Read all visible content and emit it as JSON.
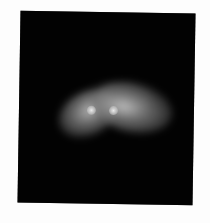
{
  "image": {
    "kind": "astronomical-photograph",
    "description": "Bilobed diffuse bright object with two compact bright cores on a black field, inside a slightly tilted black frame on white background",
    "colors": {
      "page_background": "#fdfdfd",
      "frame_background": "#020202",
      "glow_mid": "#8c8c8c",
      "core": "#e0e0e0"
    },
    "frame": {
      "top_left": [
        21,
        11
      ],
      "top_right": [
        195,
        14
      ],
      "bottom_left": [
        17,
        203
      ],
      "bottom_right": [
        192,
        205
      ]
    },
    "object": {
      "bounding_box": {
        "x": 60,
        "y": 85,
        "width": 92,
        "height": 50
      },
      "lobes": [
        {
          "name": "left-lower-lobe",
          "center": [
            80,
            115
          ]
        },
        {
          "name": "right-upper-lobe",
          "center": [
            120,
            105
          ]
        }
      ],
      "cores": [
        {
          "name": "left-core",
          "position": [
            92,
            110
          ]
        },
        {
          "name": "right-core",
          "position": [
            114,
            111
          ]
        }
      ]
    }
  }
}
